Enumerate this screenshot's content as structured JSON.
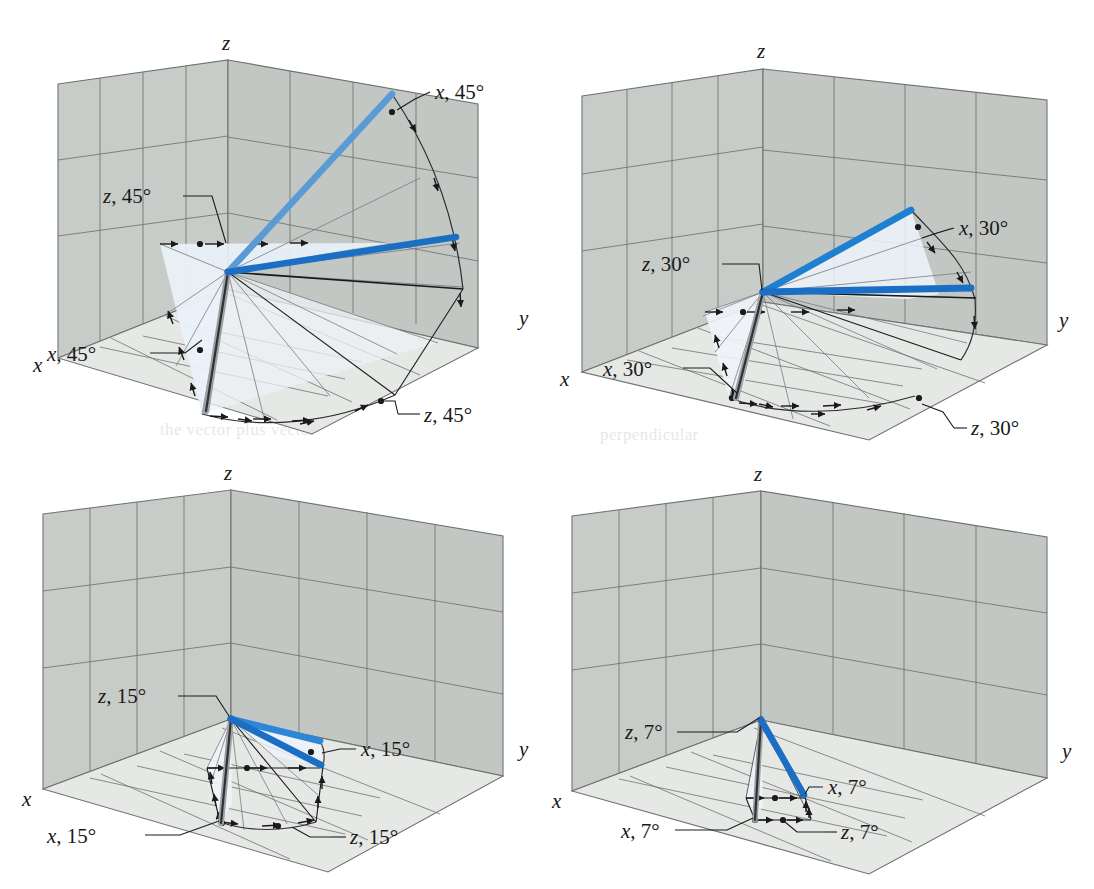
{
  "figure": {
    "type": "multi-panel-3d-diagram",
    "panel_count": 4,
    "layout": "2x2 grid",
    "background_color": "#ffffff",
    "wall_fill": "#c9ccc8",
    "wall_fill_right": "#c4c8c6",
    "floor_fill": "#e4e6e4",
    "sector_fill": "#eef4fa",
    "grid_line_color": "#6f7370",
    "ink_color": "#1a1a1a",
    "blue_light": "#5b9bd5",
    "blue_dark": "#1a6fc4",
    "gray_rod": "#8e9194"
  },
  "axis_labels": {
    "x": "x",
    "y": "y",
    "z": "z"
  },
  "panels": [
    {
      "id": "panel-45",
      "angle": "45",
      "angle_label": "45°",
      "position": "top-left",
      "callouts": [
        {
          "name": "x-callout",
          "axis": "x",
          "text": "x, 45°"
        },
        {
          "name": "z-callout-upper",
          "axis": "z",
          "text": "z, 45°"
        },
        {
          "name": "x-callout-lower",
          "axis": "x",
          "text": "x, 45°"
        },
        {
          "name": "z-callout-lower",
          "axis": "z",
          "text": "z, 45°"
        }
      ]
    },
    {
      "id": "panel-30",
      "angle": "30",
      "angle_label": "30°",
      "position": "top-right",
      "callouts": [
        {
          "name": "x-callout",
          "axis": "x",
          "text": "x, 30°"
        },
        {
          "name": "z-callout-upper",
          "axis": "z",
          "text": "z, 30°"
        },
        {
          "name": "x-callout-lower",
          "axis": "x",
          "text": "x, 30°"
        },
        {
          "name": "z-callout-lower",
          "axis": "z",
          "text": "z, 30°"
        }
      ]
    },
    {
      "id": "panel-15",
      "angle": "15",
      "angle_label": "15°",
      "position": "bottom-left",
      "callouts": [
        {
          "name": "x-callout",
          "axis": "x",
          "text": "x, 15°"
        },
        {
          "name": "z-callout-upper",
          "axis": "z",
          "text": "z, 15°"
        },
        {
          "name": "x-callout-lower",
          "axis": "x",
          "text": "x, 15°"
        },
        {
          "name": "z-callout-lower",
          "axis": "z",
          "text": "z, 15°"
        }
      ]
    },
    {
      "id": "panel-7",
      "angle": "7",
      "angle_label": "7°",
      "position": "bottom-right",
      "callouts": [
        {
          "name": "x-callout",
          "axis": "x",
          "text": "x, 7°"
        },
        {
          "name": "z-callout-upper",
          "axis": "z",
          "text": "z, 7°"
        },
        {
          "name": "x-callout-lower",
          "axis": "x",
          "text": "x, 7°"
        },
        {
          "name": "z-callout-lower",
          "axis": "z",
          "text": "z, 7°"
        }
      ]
    }
  ],
  "bleed_through": {
    "line1": "the vector plus vector",
    "line2": "perpendicular"
  }
}
